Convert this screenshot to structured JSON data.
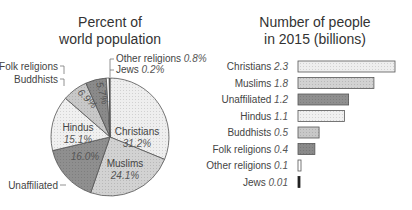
{
  "chart_data": [
    {
      "type": "pie",
      "title": "Percent of world population",
      "title_lines": [
        "Percent of",
        "world population"
      ],
      "categories": [
        "Christians",
        "Muslims",
        "Unaffiliated",
        "Hindus",
        "Buddhists",
        "Folk religions",
        "Other religions",
        "Jews"
      ],
      "values": [
        31.2,
        24.1,
        16.0,
        15.1,
        6.9,
        5.7,
        0.8,
        0.2
      ],
      "value_labels": [
        "31.2%",
        "24.1%",
        "16.0%",
        "15.1%",
        "6.9%",
        "5.7%",
        "0.8%",
        "0.2%"
      ],
      "colors": [
        "#eeeeee",
        "#d2d2d2",
        "#8f8f8f",
        "#f0f0f0",
        "#c8c8c8",
        "#8a8a8a",
        "#ffffff",
        "#222222"
      ]
    },
    {
      "type": "bar",
      "orientation": "horizontal",
      "title": "Number of people in 2015 (billions)",
      "title_lines": [
        "Number of people",
        "in 2015 (billions)"
      ],
      "categories": [
        "Christians",
        "Muslims",
        "Unaffiliated",
        "Hindus",
        "Buddhists",
        "Folk religions",
        "Other religions",
        "Jews"
      ],
      "values": [
        2.3,
        1.8,
        1.2,
        1.1,
        0.5,
        0.4,
        0.1,
        0.01
      ],
      "value_labels": [
        "2.3",
        "1.8",
        "1.2",
        "1.1",
        "0.5",
        "0.4",
        "0.1",
        "0.01"
      ],
      "colors": [
        "#eeeeee",
        "#d2d2d2",
        "#8f8f8f",
        "#f0f0f0",
        "#c8c8c8",
        "#8a8a8a",
        "#ffffff",
        "#222222"
      ],
      "xlabel": "",
      "ylabel": "",
      "grid": false
    }
  ]
}
